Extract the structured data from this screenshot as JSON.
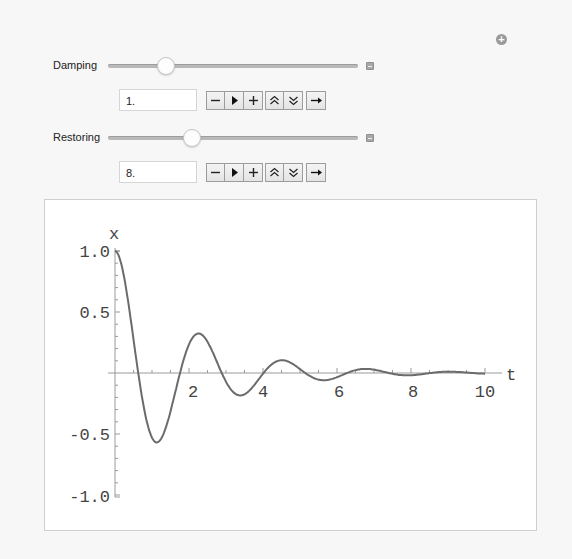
{
  "manipulate": {
    "add_icon": "plus-circle-icon",
    "controls": [
      {
        "label": "Damping",
        "value": "1.",
        "slider_fraction": 0.27,
        "buttons": [
          "decrement",
          "play",
          "increment",
          "faster",
          "slower",
          "direction"
        ]
      },
      {
        "label": "Restoring",
        "value": "8.",
        "slider_fraction": 0.36,
        "buttons": [
          "decrement",
          "play",
          "increment",
          "faster",
          "slower",
          "direction"
        ]
      }
    ]
  },
  "plot": {
    "x_axis_label": "t",
    "y_axis_label": "x",
    "x_ticks": [
      "2",
      "4",
      "6",
      "8",
      "10"
    ],
    "y_ticks": [
      "1.0",
      "0.5",
      "-0.5",
      "-1.0"
    ],
    "line_color": "#6b6b6b",
    "axis_color": "#9a9a9a"
  },
  "chart_data": {
    "type": "line",
    "title": "",
    "xlabel": "t",
    "ylabel": "x",
    "xlim": [
      0,
      10
    ],
    "ylim": [
      -1.0,
      1.0
    ],
    "x_ticks": [
      2,
      4,
      6,
      8,
      10
    ],
    "y_ticks": [
      1.0,
      0.5,
      -0.5,
      -1.0
    ],
    "grid": false,
    "legend": null,
    "series": [
      {
        "name": "x(t)",
        "x": [
          0,
          0.25,
          0.5,
          0.75,
          1.0,
          1.13,
          1.25,
          1.5,
          1.75,
          2.0,
          2.26,
          2.5,
          2.75,
          3.0,
          3.25,
          3.39,
          3.5,
          3.75,
          4.0,
          4.25,
          4.5,
          4.52,
          4.75,
          5.0,
          5.25,
          5.5,
          5.65,
          5.75,
          6.0,
          6.5,
          6.78,
          7.0,
          7.5,
          7.91,
          8.0,
          8.5,
          9.0,
          9.04,
          9.5,
          10.0
        ],
        "values": [
          1.0,
          0.78,
          0.27,
          -0.22,
          -0.52,
          -0.57,
          -0.55,
          -0.34,
          -0.03,
          0.21,
          0.32,
          0.28,
          0.13,
          -0.03,
          -0.15,
          -0.18,
          -0.17,
          -0.1,
          0.0,
          0.07,
          0.1,
          0.1,
          0.08,
          0.03,
          -0.02,
          -0.05,
          -0.06,
          -0.05,
          -0.03,
          0.03,
          0.03,
          0.03,
          -0.01,
          -0.02,
          -0.02,
          0.0,
          0.01,
          0.01,
          0.0,
          0.0
        ]
      }
    ]
  }
}
